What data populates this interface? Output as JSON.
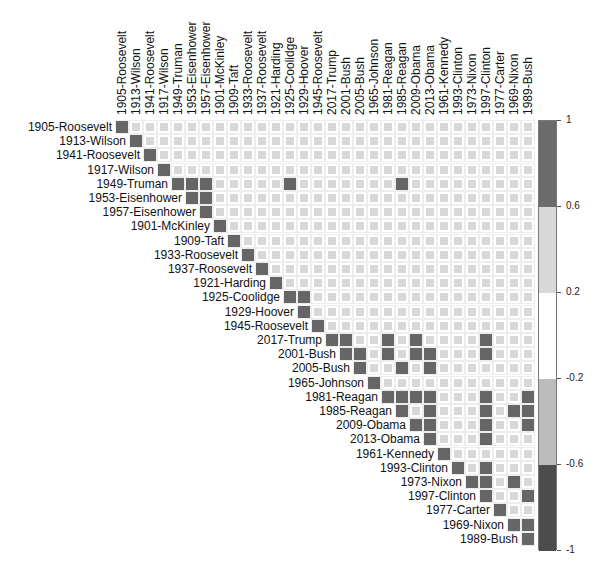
{
  "chart_data": {
    "type": "heatmap",
    "title": "",
    "subtitle": "Correlation matrix (upper triangle) of presidential addresses",
    "labels": [
      "1905-Roosevelt",
      "1913-Wilson",
      "1941-Roosevelt",
      "1917-Wilson",
      "1949-Truman",
      "1953-Eisenhower",
      "1957-Eisenhower",
      "1901-McKinley",
      "1909-Taft",
      "1933-Roosevelt",
      "1937-Roosevelt",
      "1921-Harding",
      "1925-Coolidge",
      "1929-Hoover",
      "1945-Roosevelt",
      "2017-Trump",
      "2001-Bush",
      "2005-Bush",
      "1965-Johnson",
      "1981-Reagan",
      "1985-Reagan",
      "2009-Obama",
      "2013-Obama",
      "1961-Kennedy",
      "1993-Clinton",
      "1973-Nixon",
      "1997-Clinton",
      "1977-Carter",
      "1969-Nixon",
      "1989-Bush"
    ],
    "triangle": "upper",
    "default_offdiagonal_value": 0.4,
    "strong_value": 0.8,
    "diagonal_value": 1,
    "strong_pairs": [
      [
        4,
        5
      ],
      [
        4,
        6
      ],
      [
        4,
        12
      ],
      [
        4,
        20
      ],
      [
        5,
        6
      ],
      [
        12,
        13
      ],
      [
        15,
        16
      ],
      [
        15,
        19
      ],
      [
        15,
        21
      ],
      [
        15,
        26
      ],
      [
        16,
        17
      ],
      [
        16,
        19
      ],
      [
        16,
        21
      ],
      [
        16,
        22
      ],
      [
        16,
        26
      ],
      [
        17,
        20
      ],
      [
        17,
        22
      ],
      [
        19,
        20
      ],
      [
        19,
        21
      ],
      [
        19,
        22
      ],
      [
        19,
        26
      ],
      [
        19,
        29
      ],
      [
        20,
        22
      ],
      [
        20,
        26
      ],
      [
        20,
        28
      ],
      [
        20,
        29
      ],
      [
        21,
        22
      ],
      [
        21,
        26
      ],
      [
        21,
        29
      ],
      [
        22,
        26
      ],
      [
        24,
        26
      ],
      [
        25,
        26
      ],
      [
        25,
        28
      ],
      [
        26,
        29
      ],
      [
        28,
        29
      ]
    ],
    "colorbar": {
      "range": [
        -1,
        1
      ],
      "tick_labels": [
        "1",
        "0.6",
        "0.2",
        "-0.2",
        "-0.6",
        "-1"
      ],
      "bands": [
        {
          "from": 0.6,
          "to": 1,
          "color": "#6b6b6b"
        },
        {
          "from": 0.2,
          "to": 0.6,
          "color": "#d8d8d8"
        },
        {
          "from": -0.2,
          "to": 0.2,
          "color": "#ffffff"
        },
        {
          "from": -0.6,
          "to": -0.2,
          "color": "#bcbcbc"
        },
        {
          "from": -1,
          "to": -0.6,
          "color": "#4c4c4c"
        }
      ]
    },
    "legend_position": "right",
    "grid": true
  }
}
